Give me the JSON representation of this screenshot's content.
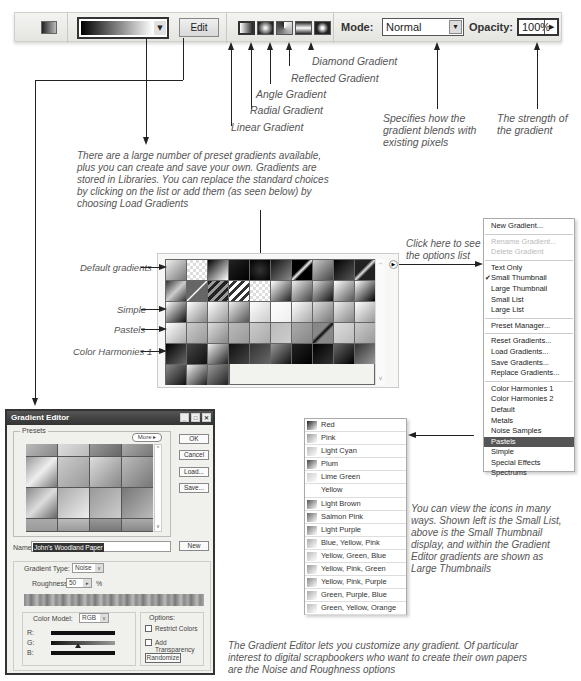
{
  "toolbar": {
    "edit_label": "Edit",
    "mode_label": "Mode:",
    "mode_value": "Normal",
    "opacity_label": "Opacity:",
    "opacity_value": "100%",
    "gradient_types": [
      "Linear Gradient",
      "Radial Gradient",
      "Angle Gradient",
      "Reflected Gradient",
      "Diamond Gradient"
    ]
  },
  "callouts": {
    "linear": "Linear Gradient",
    "radial": "Radial Gradient",
    "angle": "Angle Gradient",
    "reflected": "Reflected Gradient",
    "diamond": "Diamond Gradient",
    "mode_line1": "Specifies how the",
    "mode_line2": "gradient blends with",
    "mode_line3": "existing pixels",
    "opacity_line1": "The strength of",
    "opacity_line2": "the gradient",
    "presets_line1": "There are a large number of preset gradients available,",
    "presets_line2": "plus you can create and save your own. Gradients are",
    "presets_line3": "stored in Libraries. You can replace the standard choices",
    "presets_line4": "by clicking on the list or add them (as seen below) by",
    "presets_line5": "choosing Load Gradients",
    "options_line1": "Click here to see",
    "options_line2": "the options list",
    "views_line1": "You can view the icons in many",
    "views_line2": "ways. Shown left is the Small List,",
    "views_line3": "above is the Small Thumbnail",
    "views_line4": "display, and within the Gradient",
    "views_line5": "Editor gradients are shown as",
    "views_line6": "Large Thumbnails",
    "editor_line1": "The Gradient Editor lets you customize any gradient. Of particular",
    "editor_line2": "interest to digital scrapbookers who want to create their own papers",
    "editor_line3": "are the Noise and Roughness options"
  },
  "row_labels": {
    "default": "Default gradients",
    "simple": "Simple",
    "pastels": "Pastels",
    "harmonies": "Color Harmonies 1"
  },
  "options_menu": {
    "items": [
      {
        "label": "New Gradient...",
        "state": "normal"
      },
      {
        "label": "Rename Gradient...",
        "state": "disabled"
      },
      {
        "label": "Delete Gradient",
        "state": "disabled"
      },
      {
        "label": "Text Only",
        "state": "normal"
      },
      {
        "label": "Small Thumbnail",
        "state": "checked"
      },
      {
        "label": "Large Thumbnail",
        "state": "normal"
      },
      {
        "label": "Small List",
        "state": "normal"
      },
      {
        "label": "Large List",
        "state": "normal"
      },
      {
        "label": "Preset Manager...",
        "state": "normal"
      },
      {
        "label": "Reset Gradients...",
        "state": "normal"
      },
      {
        "label": "Load Gradients...",
        "state": "normal"
      },
      {
        "label": "Save Gradients...",
        "state": "normal"
      },
      {
        "label": "Replace Gradients...",
        "state": "normal"
      },
      {
        "label": "Color Harmonies 1",
        "state": "normal"
      },
      {
        "label": "Color Harmonies 2",
        "state": "normal"
      },
      {
        "label": "Default",
        "state": "normal"
      },
      {
        "label": "Metals",
        "state": "normal"
      },
      {
        "label": "Noise Samples",
        "state": "normal"
      },
      {
        "label": "Pastels",
        "state": "active"
      },
      {
        "label": "Simple",
        "state": "normal"
      },
      {
        "label": "Special Effects",
        "state": "normal"
      },
      {
        "label": "Spectrums",
        "state": "normal"
      }
    ]
  },
  "small_list": {
    "items": [
      "Red",
      "Pink",
      "Light Cyan",
      "Plum",
      "Lime Green",
      "Yellow",
      "Light Brown",
      "Salmon Pink",
      "Light Purple",
      "Blue, Yellow, Pink",
      "Yellow, Green, Blue",
      "Yellow, Pink, Green",
      "Yellow, Pink, Purple",
      "Green, Purple, Blue",
      "Green, Yellow, Orange"
    ]
  },
  "gradient_editor": {
    "title": "Gradient Editor",
    "presets_label": "Presets",
    "more_label": "More ▸",
    "ok_label": "OK",
    "cancel_label": "Cancel",
    "load_label": "Load...",
    "save_label": "Save...",
    "name_label": "Name:",
    "name_value": "John's Woodland Paper",
    "new_label": "New",
    "gradient_type_label": "Gradient Type:",
    "gradient_type_value": "Noise",
    "roughness_label": "Roughness:",
    "roughness_value": "50",
    "roughness_unit": "%",
    "color_model_label": "Color Model:",
    "color_model_value": "RGB",
    "channel_r": "R:",
    "channel_g": "G:",
    "channel_b": "B:",
    "options_label": "Options:",
    "restrict_colors_label": "Restrict Colors",
    "add_transparency_label": "Add Transparency",
    "randomize_label": "Randomize"
  },
  "colors": {
    "toolbar_bg": "#e8e8e4",
    "menu_active": "#555555",
    "note_text": "#555555"
  }
}
